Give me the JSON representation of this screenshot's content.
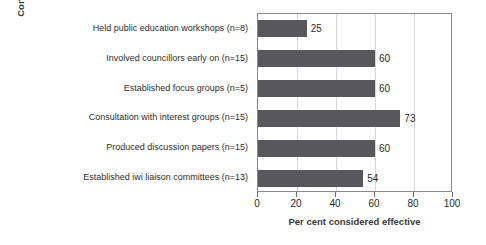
{
  "chart_data": {
    "type": "bar",
    "orientation": "horizontal",
    "title": "",
    "xlabel": "Per cent considered effective",
    "ylabel": "Consultation actions and frequency of use",
    "ylabel_lines": [
      "Consultation actions and frequency",
      "of use"
    ],
    "categories": [
      "Held public education workshops (n=8)",
      "Involved councillors early on (n=15)",
      "Established focus groups (n=5)",
      "Consultation with interest groups (n=15)",
      "Produced discussion papers (n=15)",
      "Established iwi liaison committees (n=13)"
    ],
    "values": [
      25,
      60,
      60,
      73,
      60,
      54
    ],
    "value_labels": [
      "25",
      "60",
      "60",
      "73",
      "60",
      "54"
    ],
    "xlim": [
      0,
      100
    ],
    "xticks": [
      0,
      20,
      40,
      60,
      80,
      100
    ],
    "xtick_labels": [
      "0",
      "20",
      "40",
      "60",
      "80",
      "100"
    ],
    "grid": "vertical",
    "legend": "none",
    "bar_color": "#57575c",
    "plot_border_color": "#8a8a8a",
    "gridline_color": "#d8d8d8",
    "text_color": "#2b2b2b"
  }
}
